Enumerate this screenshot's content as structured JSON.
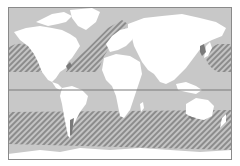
{
  "map": {
    "type": "world-map",
    "projection": "equirectangular-like",
    "colors": {
      "ocean": "#c8c8c8",
      "land": "#ffffff",
      "hatch_line": "#8a8a8a",
      "hatch_bg": "#c8c8c8",
      "equator": "#7a7a7a",
      "frame": "#8a8a8a",
      "coast_shadow": "#7a7a7a"
    },
    "equator_line": {
      "visible": true,
      "y": 90
    },
    "hatched_regions": [
      {
        "name": "north-pacific-east",
        "description": "Hatched ocean zone off western North America"
      },
      {
        "name": "north-atlantic",
        "description": "Hatched diagonal band across North Atlantic"
      },
      {
        "name": "north-pacific-west",
        "description": "Hatched ocean zone east of Japan / NW Pacific"
      },
      {
        "name": "southern-ocean-band",
        "description": "Hatched band across southern mid-latitudes of all oceans"
      }
    ],
    "legend": null,
    "labels": []
  }
}
